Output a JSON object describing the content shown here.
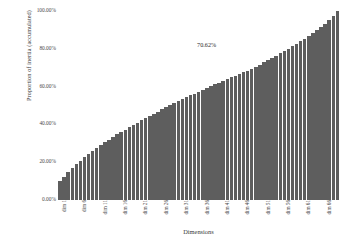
{
  "chart_data": {
    "type": "bar",
    "title": "",
    "xlabel": "Dimensions",
    "ylabel": "Proportion of inertia (accumulated)",
    "ylim": [
      0,
      100
    ],
    "grid": false,
    "legend": "none",
    "bar_color": "#5e5e5e",
    "background_color": "#ffffff",
    "ytick_labels": [
      "100.00%",
      "80.00%",
      "60.00%",
      "40.00%",
      "20.00%",
      "0.00%"
    ],
    "ytick_values": [
      100,
      80,
      60,
      40,
      20,
      0
    ],
    "xtick_labels": [
      "dim 1",
      "dim 6",
      "dim 11",
      "dim 16",
      "dim 21",
      "dim 26",
      "dim 31",
      "dim 36",
      "dim 41",
      "dim 46",
      "dim 51",
      "dim 56",
      "dim 61",
      "dim 66"
    ],
    "xtick_indices": [
      0,
      5,
      10,
      15,
      20,
      25,
      30,
      35,
      40,
      45,
      50,
      55,
      60,
      65
    ],
    "categories": [
      "dim 1",
      "dim 2",
      "dim 3",
      "dim 4",
      "dim 5",
      "dim 6",
      "dim 7",
      "dim 8",
      "dim 9",
      "dim 10",
      "dim 11",
      "dim 12",
      "dim 13",
      "dim 14",
      "dim 15",
      "dim 16",
      "dim 17",
      "dim 18",
      "dim 19",
      "dim 20",
      "dim 21",
      "dim 22",
      "dim 23",
      "dim 24",
      "dim 25",
      "dim 26",
      "dim 27",
      "dim 28",
      "dim 29",
      "dim 30",
      "dim 31",
      "dim 32",
      "dim 33",
      "dim 34",
      "dim 35",
      "dim 36",
      "dim 37",
      "dim 38",
      "dim 39",
      "dim 40",
      "dim 41",
      "dim 42",
      "dim 43",
      "dim 44",
      "dim 45",
      "dim 46",
      "dim 47",
      "dim 48",
      "dim 49",
      "dim 50",
      "dim 51",
      "dim 52",
      "dim 53",
      "dim 54",
      "dim 55",
      "dim 56",
      "dim 57",
      "dim 58",
      "dim 59",
      "dim 60",
      "dim 61",
      "dim 62",
      "dim 63",
      "dim 64",
      "dim 65",
      "dim 66",
      "dim 67",
      "dim 68",
      "dim 69"
    ],
    "values": [
      9.8,
      12.4,
      14.7,
      16.9,
      18.9,
      20.8,
      22.6,
      24.3,
      25.9,
      27.5,
      29.0,
      30.5,
      31.9,
      33.3,
      34.7,
      36.0,
      37.3,
      38.6,
      39.8,
      41.0,
      42.2,
      43.4,
      44.6,
      45.7,
      46.8,
      47.9,
      49.0,
      50.1,
      51.2,
      52.2,
      53.3,
      54.3,
      55.3,
      56.3,
      57.3,
      58.3,
      59.3,
      60.2,
      61.2,
      62.1,
      63.1,
      64.0,
      64.9,
      65.8,
      66.7,
      67.6,
      68.5,
      69.4,
      70.62,
      71.6,
      72.8,
      74.0,
      75.2,
      76.4,
      77.6,
      78.8,
      80.0,
      81.3,
      82.6,
      83.9,
      85.3,
      86.7,
      88.2,
      89.8,
      91.5,
      93.3,
      95.3,
      97.5,
      100.0
    ],
    "annotations": [
      {
        "text": "70.62%",
        "x_index": 36,
        "y_value": 84.0
      }
    ]
  }
}
